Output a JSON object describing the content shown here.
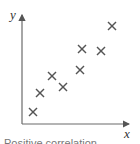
{
  "chart_data": {
    "type": "scatter",
    "title": "",
    "xlabel": "x",
    "ylabel": "y",
    "marker": "x",
    "grid": false,
    "legend": null,
    "x": [
      1,
      2,
      3,
      4,
      5,
      6,
      6.2,
      7.6,
      8.6
    ],
    "y": [
      1,
      2.3,
      3.3,
      2.8,
      4,
      5.6,
      4.8,
      5.5,
      7.4
    ],
    "points_px": [
      [
        33,
        112
      ],
      [
        40,
        93
      ],
      [
        52,
        76
      ],
      [
        63,
        87
      ],
      [
        80,
        70
      ],
      [
        82,
        49
      ],
      [
        101,
        51
      ],
      [
        112,
        26
      ]
    ],
    "annotation": "Positive correlation",
    "colors": {
      "axis": "#6b6b6b",
      "marker": "#555555",
      "text": "#333333"
    }
  },
  "caption": "Positive correlation"
}
